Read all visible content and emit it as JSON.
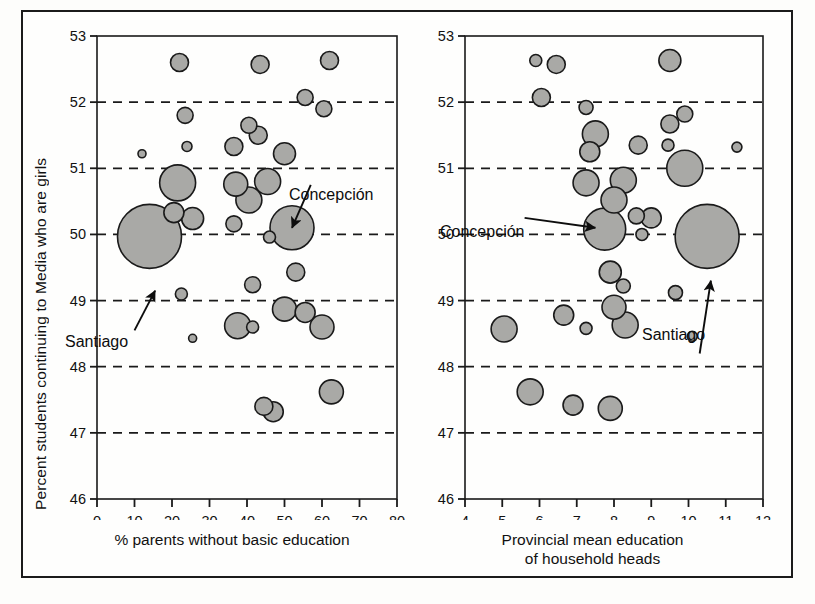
{
  "figure": {
    "y_axis_label": "Percent students continuing to Media who are girls",
    "background": "#fdfdfb",
    "bubble_fill": "#a9a9a6",
    "bubble_stroke": "#1a1a1a",
    "grid_color": "#1a1a1a"
  },
  "annotations": {
    "concepcion": "Concepción",
    "santiago": "Santiago"
  },
  "chart_data": [
    {
      "type": "scatter",
      "panel": "left",
      "title": "",
      "xlabel": "% parents without basic education",
      "ylabel": "Percent students continuing to Media who are girls",
      "xlim": [
        0,
        80
      ],
      "ylim": [
        46,
        53
      ],
      "xticks": [
        0,
        10,
        20,
        30,
        40,
        50,
        60,
        70,
        80
      ],
      "xticklabels": [
        "0",
        "10",
        "20",
        "30",
        "40",
        "50",
        "60",
        "70",
        "80"
      ],
      "yticks": [
        46,
        47,
        48,
        49,
        50,
        51,
        52,
        53
      ],
      "yticklabels": [
        "46",
        "47",
        "48",
        "49",
        "50",
        "51",
        "52",
        "53"
      ],
      "grid": "horizontal-dashed",
      "gridlines_y": [
        47,
        48,
        49,
        50,
        51,
        52
      ],
      "legend": "none",
      "marker": "bubble",
      "size_meaning": "population",
      "annotations": [
        {
          "label": "Concepción",
          "x": 52,
          "y": 50.1,
          "text_x": 57,
          "text_y": 50.75
        },
        {
          "label": "Santiago",
          "x": 15.5,
          "y": 49.15,
          "text_x": 10,
          "text_y": 48.55
        }
      ],
      "points": [
        {
          "x": 22.0,
          "y": 52.6,
          "r": 9
        },
        {
          "x": 43.5,
          "y": 52.57,
          "r": 9
        },
        {
          "x": 62.0,
          "y": 52.63,
          "r": 9
        },
        {
          "x": 55.5,
          "y": 52.07,
          "r": 8
        },
        {
          "x": 60.5,
          "y": 51.9,
          "r": 8
        },
        {
          "x": 23.5,
          "y": 51.8,
          "r": 8
        },
        {
          "x": 40.5,
          "y": 51.65,
          "r": 8
        },
        {
          "x": 43.0,
          "y": 51.5,
          "r": 9
        },
        {
          "x": 12.0,
          "y": 51.22,
          "r": 4
        },
        {
          "x": 24.0,
          "y": 51.33,
          "r": 5
        },
        {
          "x": 36.5,
          "y": 51.33,
          "r": 9
        },
        {
          "x": 50.0,
          "y": 51.22,
          "r": 11
        },
        {
          "x": 21.5,
          "y": 50.78,
          "r": 18
        },
        {
          "x": 37.0,
          "y": 50.76,
          "r": 12
        },
        {
          "x": 45.5,
          "y": 50.8,
          "r": 13
        },
        {
          "x": 40.5,
          "y": 50.52,
          "r": 13
        },
        {
          "x": 14.0,
          "y": 49.97,
          "r": 32
        },
        {
          "x": 20.5,
          "y": 50.33,
          "r": 10
        },
        {
          "x": 25.5,
          "y": 50.24,
          "r": 11
        },
        {
          "x": 36.5,
          "y": 50.16,
          "r": 8
        },
        {
          "x": 52.0,
          "y": 50.1,
          "r": 22
        },
        {
          "x": 46.0,
          "y": 49.96,
          "r": 6
        },
        {
          "x": 53.0,
          "y": 49.43,
          "r": 9
        },
        {
          "x": 41.5,
          "y": 49.24,
          "r": 8
        },
        {
          "x": 22.5,
          "y": 49.1,
          "r": 6
        },
        {
          "x": 50.0,
          "y": 48.87,
          "r": 12
        },
        {
          "x": 55.5,
          "y": 48.82,
          "r": 10
        },
        {
          "x": 37.5,
          "y": 48.62,
          "r": 13
        },
        {
          "x": 41.5,
          "y": 48.6,
          "r": 6
        },
        {
          "x": 60.0,
          "y": 48.6,
          "r": 12
        },
        {
          "x": 25.5,
          "y": 48.43,
          "r": 4
        },
        {
          "x": 62.5,
          "y": 47.62,
          "r": 12
        },
        {
          "x": 44.5,
          "y": 47.4,
          "r": 9
        },
        {
          "x": 47.0,
          "y": 47.32,
          "r": 10
        }
      ]
    },
    {
      "type": "scatter",
      "panel": "right",
      "title": "",
      "xlabel_line1": "Provincial mean education",
      "xlabel_line2": "of household heads",
      "xlabel": "Provincial mean education of household heads",
      "ylabel": "Percent students continuing to Media who are girls",
      "xlim": [
        4,
        12
      ],
      "ylim": [
        46,
        53
      ],
      "xticks": [
        4,
        5,
        6,
        7,
        8,
        9,
        10,
        11,
        12
      ],
      "xticklabels": [
        "4",
        "5",
        "6",
        "7",
        "8",
        "9",
        "10",
        "11",
        "12"
      ],
      "yticks": [
        46,
        47,
        48,
        49,
        50,
        51,
        52,
        53
      ],
      "yticklabels": [
        "46",
        "47",
        "48",
        "49",
        "50",
        "51",
        "52",
        "53"
      ],
      "grid": "horizontal-dashed",
      "gridlines_y": [
        47,
        48,
        49,
        50,
        51,
        52
      ],
      "legend": "none",
      "marker": "bubble",
      "size_meaning": "population",
      "annotations": [
        {
          "label": "Concepción",
          "x": 7.5,
          "y": 50.1,
          "text_x": 5.6,
          "text_y": 50.25
        },
        {
          "label": "Santiago",
          "x": 10.6,
          "y": 49.3,
          "text_x": 10.3,
          "text_y": 48.2
        }
      ],
      "points": [
        {
          "x": 5.9,
          "y": 52.63,
          "r": 6
        },
        {
          "x": 6.45,
          "y": 52.57,
          "r": 9
        },
        {
          "x": 9.5,
          "y": 52.63,
          "r": 11
        },
        {
          "x": 6.05,
          "y": 52.07,
          "r": 9
        },
        {
          "x": 7.25,
          "y": 51.92,
          "r": 7
        },
        {
          "x": 7.5,
          "y": 51.52,
          "r": 13
        },
        {
          "x": 7.35,
          "y": 51.25,
          "r": 10
        },
        {
          "x": 8.65,
          "y": 51.35,
          "r": 9
        },
        {
          "x": 9.5,
          "y": 51.67,
          "r": 9
        },
        {
          "x": 9.9,
          "y": 51.82,
          "r": 8
        },
        {
          "x": 9.45,
          "y": 51.35,
          "r": 6
        },
        {
          "x": 11.3,
          "y": 51.32,
          "r": 5
        },
        {
          "x": 7.25,
          "y": 50.78,
          "r": 13
        },
        {
          "x": 8.25,
          "y": 50.82,
          "r": 13
        },
        {
          "x": 8.0,
          "y": 50.52,
          "r": 13
        },
        {
          "x": 9.9,
          "y": 51.0,
          "r": 18
        },
        {
          "x": 8.6,
          "y": 50.28,
          "r": 8
        },
        {
          "x": 7.75,
          "y": 50.08,
          "r": 21
        },
        {
          "x": 9.0,
          "y": 50.25,
          "r": 10
        },
        {
          "x": 8.75,
          "y": 50.0,
          "r": 6
        },
        {
          "x": 10.5,
          "y": 49.97,
          "r": 32
        },
        {
          "x": 7.9,
          "y": 49.43,
          "r": 11
        },
        {
          "x": 8.25,
          "y": 49.22,
          "r": 7
        },
        {
          "x": 9.65,
          "y": 49.12,
          "r": 7
        },
        {
          "x": 8.0,
          "y": 48.9,
          "r": 12
        },
        {
          "x": 6.65,
          "y": 48.78,
          "r": 10
        },
        {
          "x": 8.3,
          "y": 48.63,
          "r": 13
        },
        {
          "x": 7.25,
          "y": 48.58,
          "r": 6
        },
        {
          "x": 5.05,
          "y": 48.57,
          "r": 13
        },
        {
          "x": 10.1,
          "y": 48.46,
          "r": 5
        },
        {
          "x": 5.75,
          "y": 47.62,
          "r": 13
        },
        {
          "x": 6.9,
          "y": 47.42,
          "r": 10
        },
        {
          "x": 7.9,
          "y": 47.37,
          "r": 12
        }
      ]
    }
  ]
}
